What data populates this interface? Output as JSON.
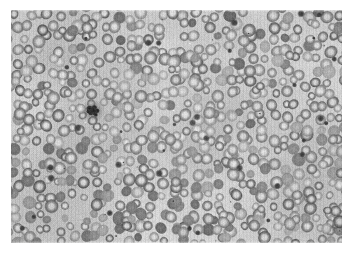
{
  "image": {
    "kind": "light-microscopy-photomicrograph",
    "title": "Peripheral blood smear",
    "subject": "Red blood cells (erythrocytes) on a stained peripheral blood film",
    "color_mode": "grayscale",
    "frame": {
      "canvas_width": 352,
      "canvas_height": 257,
      "margin_color": "#ffffff",
      "photo_left": 11,
      "photo_top": 10,
      "photo_width": 331,
      "photo_height": 233
    },
    "caption": "",
    "palette": {
      "background_field": "#d7d7d4",
      "background_field_light": "#e2e2df",
      "cell_rim_mid": "#9a9a97",
      "cell_rim_dark": "#7c7c79",
      "cell_rim_darkest": "#676764",
      "cell_pallor": "#cfcfcc",
      "platelet_dark": "#3a3a38",
      "clump_darkest": "#1e1e1d",
      "margin": "#ffffff"
    },
    "texture": {
      "scanlines": "vertical",
      "scanline_opacity": 0.045,
      "film_grain": true,
      "grain_strength": 9
    },
    "features": {
      "erythrocyte_count_approx": 560,
      "erythrocyte_diameter_px_range": [
        8,
        14
      ],
      "central_pallor": true,
      "platelet_clump": {
        "label": "dark platelet clump",
        "center_x": 93,
        "center_y": 111,
        "width": 16,
        "height": 16
      },
      "scattered_platelets_approx": 34,
      "artifact_specks_approx": 26
    },
    "rng_seed": 20240917
  }
}
